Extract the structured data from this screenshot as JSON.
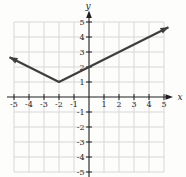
{
  "chart_data": {
    "type": "line",
    "function": "y = 0.5*|x + 2| + 1",
    "vertex": [
      -2,
      1
    ],
    "y_intercept": [
      0,
      2
    ],
    "slope_left": -0.5,
    "slope_right": 0.5,
    "series": [
      {
        "name": "absolute-value-curve",
        "points": [
          [
            -5.3,
            2.65
          ],
          [
            -2,
            1
          ],
          [
            5.3,
            4.65
          ]
        ],
        "arrow_both_ends": true
      }
    ],
    "xlabel": "x",
    "ylabel": "y",
    "x_tick_labels": [
      -5,
      -4,
      -3,
      -2,
      -1,
      1,
      2,
      3,
      4,
      5
    ],
    "y_tick_labels": [
      5,
      4,
      3,
      2,
      1,
      -1,
      -2,
      -3,
      -4,
      -5
    ],
    "grid_x": [
      -5,
      -4,
      -3,
      -2,
      -1,
      1,
      2,
      3,
      4,
      5
    ],
    "grid_y": [
      5,
      4,
      3,
      2,
      1,
      -1,
      -2,
      -3,
      -4,
      -5
    ],
    "xlim": [
      -5.5,
      5.6
    ],
    "ylim": [
      -5.5,
      5.6
    ],
    "grid": true,
    "legend": false
  },
  "colors": {
    "background": "#fdfdfc",
    "grid": "#d7d7d9",
    "axis": "#1e1e1e",
    "curve": "#3e3e3e",
    "text": "#1e1e1e"
  }
}
